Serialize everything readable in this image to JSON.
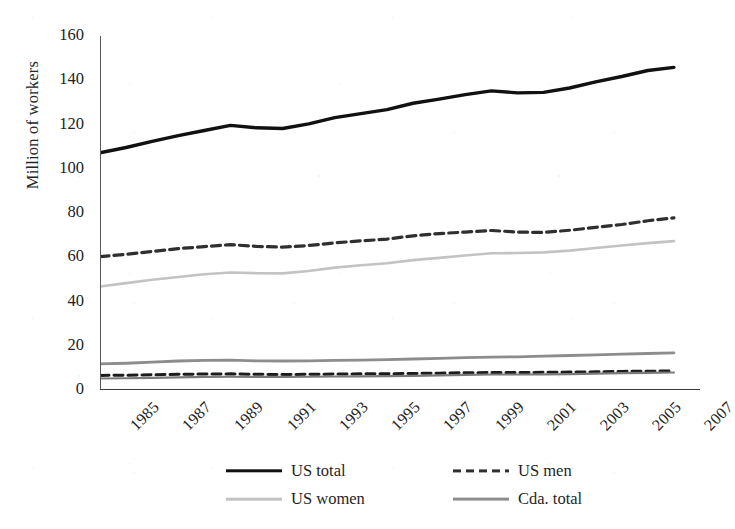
{
  "chart_data": {
    "type": "line",
    "title": "",
    "xlabel": "",
    "ylabel": "Million of workers",
    "ylim": [
      0,
      160
    ],
    "yticks": [
      0,
      20,
      40,
      60,
      80,
      100,
      120,
      140,
      160
    ],
    "xlim": [
      1985,
      2008
    ],
    "x": [
      1985,
      1986,
      1987,
      1988,
      1989,
      1990,
      1991,
      1992,
      1993,
      1994,
      1995,
      1996,
      1997,
      1998,
      1999,
      2000,
      2001,
      2002,
      2003,
      2004,
      2005,
      2006,
      2007
    ],
    "xtick_labels": [
      "1985",
      "1987",
      "1989",
      "1991",
      "1993",
      "1995",
      "1997",
      "1999",
      "2001",
      "2003",
      "2005",
      "2007"
    ],
    "xticks": [
      1985,
      1987,
      1989,
      1991,
      1993,
      1995,
      1997,
      1999,
      2001,
      2003,
      2005,
      2007
    ],
    "grid": false,
    "legend_position": "bottom",
    "series": [
      {
        "name": "US total",
        "style": "solid",
        "color": "#111111",
        "width": 3.4,
        "values": [
          107.2,
          109.6,
          112.4,
          115.0,
          117.3,
          119.6,
          118.5,
          118.2,
          120.3,
          123.1,
          124.9,
          126.7,
          129.6,
          131.5,
          133.5,
          135.2,
          134.3,
          134.5,
          136.5,
          139.3,
          141.7,
          144.4,
          145.8
        ]
      },
      {
        "name": "US men",
        "style": "dashed",
        "color": "#2f2f2f",
        "width": 3.2,
        "values": [
          60.3,
          61.3,
          62.6,
          63.9,
          64.8,
          65.7,
          64.9,
          64.6,
          65.3,
          66.5,
          67.4,
          68.2,
          69.7,
          70.7,
          71.4,
          72.1,
          71.4,
          71.2,
          72.2,
          73.5,
          74.8,
          76.5,
          77.8
        ]
      },
      {
        "name": "US women",
        "style": "solid",
        "color": "#c3c3c3",
        "width": 2.6,
        "values": [
          46.8,
          48.3,
          49.8,
          51.1,
          52.3,
          53.1,
          52.8,
          52.7,
          53.8,
          55.3,
          56.4,
          57.3,
          58.7,
          59.7,
          60.8,
          61.8,
          61.9,
          62.2,
          63.0,
          64.2,
          65.3,
          66.4,
          67.3
        ]
      },
      {
        "name": "Cda. total",
        "style": "solid",
        "color": "#8d8d8d",
        "width": 2.8,
        "values": [
          11.8,
          12.1,
          12.6,
          13.1,
          13.4,
          13.5,
          13.2,
          13.1,
          13.2,
          13.4,
          13.5,
          13.7,
          14.0,
          14.3,
          14.6,
          14.9,
          15.0,
          15.3,
          15.6,
          15.9,
          16.2,
          16.5,
          16.8
        ]
      },
      {
        "name": "Cda. men",
        "style": "dashed",
        "color": "#1c1c1c",
        "width": 3.0,
        "values": [
          6.6,
          6.7,
          6.9,
          7.1,
          7.2,
          7.3,
          7.1,
          7.0,
          7.1,
          7.2,
          7.3,
          7.3,
          7.5,
          7.6,
          7.8,
          7.9,
          7.9,
          8.0,
          8.1,
          8.2,
          8.4,
          8.5,
          8.6
        ]
      },
      {
        "name": "Cda. women",
        "style": "solid",
        "color": "#7a7a7a",
        "width": 2.2,
        "values": [
          5.2,
          5.3,
          5.5,
          5.7,
          5.9,
          6.0,
          5.9,
          5.9,
          6.0,
          6.1,
          6.2,
          6.3,
          6.4,
          6.6,
          6.8,
          7.0,
          7.0,
          7.1,
          7.2,
          7.4,
          7.6,
          7.7,
          7.9
        ]
      }
    ],
    "legend": [
      {
        "label": "US total",
        "style": "solid-black"
      },
      {
        "label": "US men",
        "style": "dash-dark"
      },
      {
        "label": "US women",
        "style": "light"
      },
      {
        "label": "Cda. total",
        "style": "mid"
      }
    ]
  }
}
